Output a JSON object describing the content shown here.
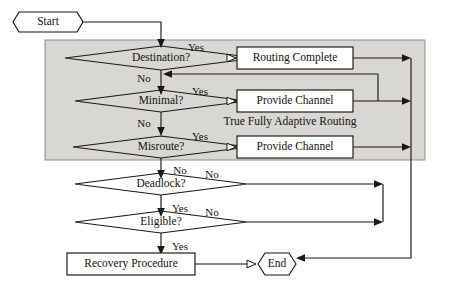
{
  "diagram": {
    "background_color": "#ffffff",
    "line_color": "#1a1714",
    "region_fill_color": "#d8d7d3",
    "region_border_color": "#8e8d89",
    "box_fill_color": "#ffffff"
  },
  "nodes": {
    "start": {
      "label": "Start",
      "shape": "octagon"
    },
    "destination": {
      "label": "Destination?",
      "shape": "diamond"
    },
    "minimal": {
      "label": "Minimal?",
      "shape": "diamond"
    },
    "misroute": {
      "label": "Misroute?",
      "shape": "diamond"
    },
    "deadlock": {
      "label": "Deadlock?",
      "shape": "diamond"
    },
    "eligible": {
      "label": "Eligible?",
      "shape": "diamond"
    },
    "routing_complete": {
      "label": "Routing Complete",
      "shape": "rectangle"
    },
    "provide_channel_1": {
      "label": "Provide Channel",
      "shape": "rectangle"
    },
    "provide_channel_2": {
      "label": "Provide Channel",
      "shape": "rectangle"
    },
    "recovery_procedure": {
      "label": "Recovery Procedure",
      "shape": "rectangle"
    },
    "end": {
      "label": "End",
      "shape": "octagon"
    }
  },
  "region": {
    "label": "True Fully Adaptive Routing"
  },
  "edge_labels": {
    "destination_yes": "Yes",
    "destination_no": "No",
    "minimal_yes": "Yes",
    "minimal_no": "No",
    "misroute_yes": "Yes",
    "misroute_no": "No",
    "deadlock_no": "No",
    "deadlock_yes": "Yes",
    "eligible_no": "No",
    "eligible_yes": "Yes"
  }
}
